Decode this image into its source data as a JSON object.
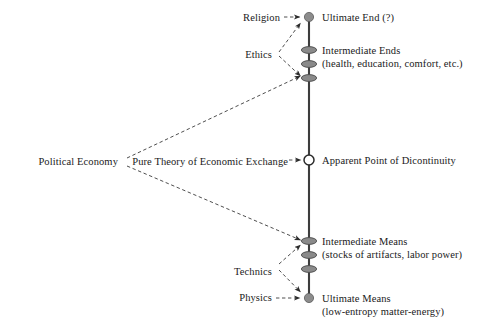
{
  "diagram": {
    "type": "node-link-diagram",
    "canvas": {
      "width": 486,
      "height": 331
    },
    "colors": {
      "axis_line": "#3d3d3d",
      "node_fill": "#8c8c8c",
      "node_stroke": "#4a4a4a",
      "open_node_fill": "#ffffff",
      "arrow": "#2b2b2b",
      "text": "#1a1a1a",
      "background": "#ffffff"
    },
    "axis": {
      "name": "ends-means-axis",
      "x": 309,
      "y_top": 17,
      "y_bottom": 300
    },
    "right_labels": [
      {
        "id": "ultimate-end",
        "main": "Ultimate End (?)",
        "sub": "",
        "x": 322,
        "y": 12
      },
      {
        "id": "intermediate-ends",
        "main": "Intermediate Ends",
        "sub": "(health, education, comfort, etc.)",
        "x": 322,
        "y": 45
      },
      {
        "id": "apparent-point-of-discontinuity",
        "main": "Apparent Point of Dicontinuity",
        "sub": "",
        "x": 322,
        "y": 155
      },
      {
        "id": "intermediate-means",
        "main": "Intermediate Means",
        "sub": "(stocks of artifacts, labor power)",
        "x": 322,
        "y": 239
      },
      {
        "id": "ultimate-means",
        "main": "Ultimate Means",
        "sub": "(low-entropy matter-energy)",
        "x": 322,
        "y": 292
      }
    ],
    "left_labels": [
      {
        "id": "religion",
        "text": "Religion",
        "right_x": 280,
        "y": 12
      },
      {
        "id": "ethics",
        "text": "Ethics",
        "right_x": 272,
        "y": 49
      },
      {
        "id": "political-economy",
        "text": "Political Economy",
        "right_x": 118,
        "y": 157
      },
      {
        "id": "pure-theory-of-economic-exchange",
        "text": "Pure Theory of Economic Exchange",
        "right_x": 288,
        "y": 157
      },
      {
        "id": "technics",
        "text": "Technics",
        "right_x": 272,
        "y": 266
      },
      {
        "id": "physics",
        "text": "Physics",
        "right_x": 272,
        "y": 291
      }
    ],
    "axis_nodes": [
      {
        "id": "node-ultimate-end",
        "shape": "circle",
        "cx": 309,
        "cy": 17,
        "r": 4.6
      },
      {
        "id": "node-intermediate-ends-1",
        "shape": "ellipse",
        "cx": 309,
        "cy": 50,
        "rx": 7.5,
        "ry": 3.4
      },
      {
        "id": "node-intermediate-ends-2",
        "shape": "ellipse",
        "cx": 309,
        "cy": 64,
        "rx": 7.5,
        "ry": 3.4
      },
      {
        "id": "node-intermediate-ends-3",
        "shape": "ellipse",
        "cx": 309,
        "cy": 78,
        "rx": 7.5,
        "ry": 3.4
      },
      {
        "id": "node-apparent-discontinuity",
        "shape": "open-circle",
        "cx": 309,
        "cy": 160,
        "r": 5.0
      },
      {
        "id": "node-intermediate-means-1",
        "shape": "ellipse",
        "cx": 309,
        "cy": 241,
        "rx": 7.5,
        "ry": 3.4
      },
      {
        "id": "node-intermediate-means-2",
        "shape": "ellipse",
        "cx": 309,
        "cy": 255,
        "rx": 7.5,
        "ry": 3.4
      },
      {
        "id": "node-intermediate-means-3",
        "shape": "ellipse",
        "cx": 309,
        "cy": 269,
        "rx": 7.5,
        "ry": 3.4
      },
      {
        "id": "node-ultimate-means",
        "shape": "circle",
        "cx": 309,
        "cy": 298,
        "r": 4.6
      }
    ],
    "connectors": [
      {
        "id": "religion-to-ultimate-end",
        "from": "religion",
        "to": "node-ultimate-end",
        "style": "dashed-arrow",
        "x1": 284,
        "y1": 17,
        "x2": 301,
        "y2": 17
      },
      {
        "id": "ethics-to-ultimate-end",
        "from": "ethics",
        "to": "node-ultimate-end",
        "style": "dashed-arrow",
        "x1": 279,
        "y1": 52,
        "x2": 301,
        "y2": 22
      },
      {
        "id": "ethics-to-intermediate-ends",
        "from": "ethics",
        "to": "node-intermediate-ends-3",
        "style": "dashed-arrow",
        "x1": 279,
        "y1": 56,
        "x2": 301,
        "y2": 76
      },
      {
        "id": "political-economy-branch-up",
        "from": "political-economy",
        "to": "node-intermediate-ends-3",
        "style": "dashed-arrow",
        "x1": 127,
        "y1": 158,
        "x2": 301,
        "y2": 76
      },
      {
        "id": "political-economy-branch-down",
        "from": "political-economy",
        "to": "node-intermediate-means-1",
        "style": "dashed-arrow",
        "x1": 127,
        "y1": 166,
        "x2": 301,
        "y2": 240
      },
      {
        "id": "pure-theory-to-discontinuity",
        "from": "pure-theory-of-economic-exchange",
        "to": "node-apparent-discontinuity",
        "style": "dashed-arrow",
        "x1": 291,
        "y1": 160,
        "x2": 302,
        "y2": 160
      },
      {
        "id": "technics-to-intermediate-means",
        "from": "technics",
        "to": "node-intermediate-means-1",
        "style": "dashed-arrow",
        "x1": 279,
        "y1": 264,
        "x2": 301,
        "y2": 245
      },
      {
        "id": "technics-to-ultimate-means",
        "from": "technics",
        "to": "node-ultimate-means",
        "style": "dashed-arrow",
        "x1": 279,
        "y1": 270,
        "x2": 301,
        "y2": 292
      },
      {
        "id": "physics-to-ultimate-means",
        "from": "physics",
        "to": "node-ultimate-means",
        "style": "dashed-arrow",
        "x1": 276,
        "y1": 298,
        "x2": 301,
        "y2": 298
      }
    ]
  }
}
